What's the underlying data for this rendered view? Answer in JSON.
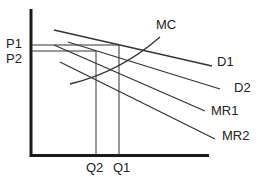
{
  "diagram": {
    "type": "economics-monopoly-demand-shift",
    "colors": {
      "line": "#333333",
      "axis": "#1a1a1a",
      "text": "#222222",
      "background": "#ffffff"
    },
    "axes": {
      "y_axis": {
        "x": 31,
        "y1": 9,
        "y2": 156
      },
      "x_axis": {
        "y": 155,
        "x1": 31,
        "x2": 209
      }
    },
    "labels": {
      "p1": "P1",
      "p2": "P2",
      "q1": "Q1",
      "q2": "Q2",
      "mc": "MC",
      "d1": "D1",
      "d2": "D2",
      "mr1": "MR1",
      "mr2": "MR2"
    },
    "curves": [
      {
        "name": "D1",
        "x1": 54,
        "y1": 30,
        "x2": 212,
        "y2": 66
      },
      {
        "name": "D2",
        "x1": 68,
        "y1": 42,
        "x2": 220,
        "y2": 89
      },
      {
        "name": "MR1",
        "x1": 54,
        "y1": 45,
        "x2": 205,
        "y2": 111
      },
      {
        "name": "MR2",
        "x1": 60,
        "y1": 62,
        "x2": 215,
        "y2": 139
      }
    ],
    "mc_curve": "M70,84 Q120,72 160,37",
    "guides": {
      "p1": {
        "y": 45,
        "x_end": 119
      },
      "p2": {
        "y": 51,
        "x_end": 96
      },
      "q1": {
        "x": 119,
        "y_start": 45
      },
      "q2": {
        "x": 96,
        "y_start": 51
      }
    }
  }
}
